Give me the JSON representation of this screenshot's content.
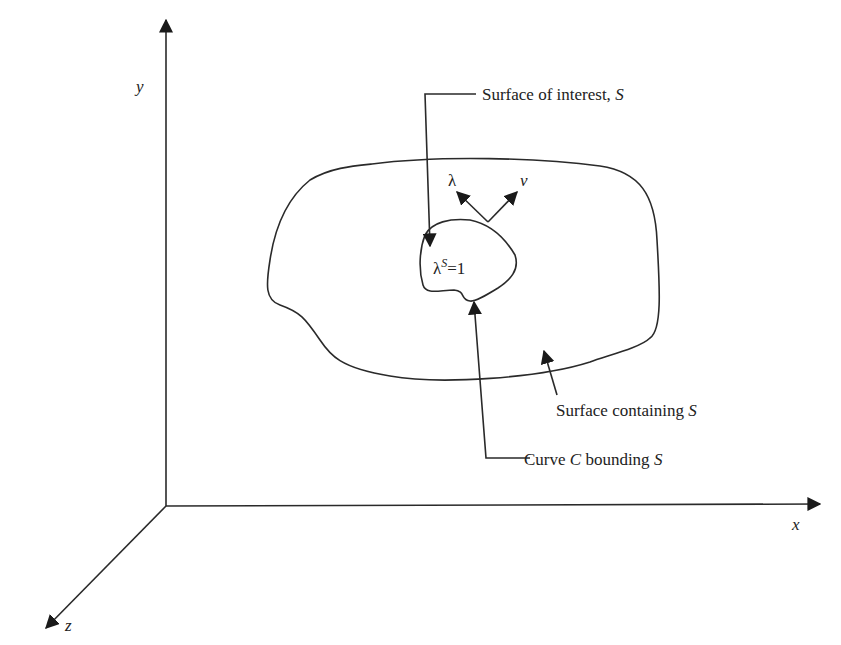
{
  "figure": {
    "axes": {
      "x_label": "x",
      "y_label": "y",
      "z_label": "z"
    },
    "labels": {
      "surface_of_interest": "Surface of interest, ",
      "surface_of_interest_symbol": "S",
      "surface_containing": "Surface containing ",
      "surface_containing_symbol": "S",
      "curve_prefix": "Curve ",
      "curve_symbol": "C",
      "curve_mid": " bounding ",
      "curve_bound_symbol": "S",
      "lambda_vector": "λ",
      "nu_vector": "ν",
      "lambda_s_base": "λ",
      "lambda_s_sup": "S",
      "lambda_s_value": "=1"
    },
    "colors": {
      "line": "#2a2a2a",
      "text": "#222222",
      "background": "#ffffff"
    }
  }
}
